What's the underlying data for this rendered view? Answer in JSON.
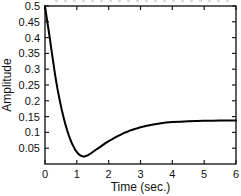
{
  "figure": {
    "background": "#ffffff"
  },
  "chart_data": {
    "type": "line",
    "xlabel": "Time (sec.)",
    "ylabel": "Amplitude",
    "xlim": [
      0,
      6
    ],
    "ylim": [
      0,
      0.5
    ],
    "xticks": [
      [
        0,
        "0"
      ],
      [
        1,
        "1"
      ],
      [
        2,
        "2"
      ],
      [
        3,
        "3"
      ],
      [
        4,
        "4"
      ],
      [
        5,
        "5"
      ],
      [
        6,
        "6"
      ]
    ],
    "yticks": [
      [
        0.05,
        "0.05"
      ],
      [
        0.1,
        "0.1"
      ],
      [
        0.15,
        "0.15"
      ],
      [
        0.2,
        "0.2"
      ],
      [
        0.25,
        "0.25"
      ],
      [
        0.3,
        "0.3"
      ],
      [
        0.35,
        "0.35"
      ],
      [
        0.4,
        "0.4"
      ],
      [
        0.45,
        "0.45"
      ],
      [
        0.5,
        "0.5"
      ]
    ],
    "grid": false,
    "legend": null,
    "box": true,
    "line_color": "#000000",
    "line_width": 2,
    "axis_color": "#1a1a1a",
    "series": [
      {
        "name": "response-curve",
        "points": [
          [
            0.0,
            0.5
          ],
          [
            0.05,
            0.465
          ],
          [
            0.1,
            0.432
          ],
          [
            0.15,
            0.398
          ],
          [
            0.2,
            0.362
          ],
          [
            0.25,
            0.328
          ],
          [
            0.3,
            0.295
          ],
          [
            0.35,
            0.263
          ],
          [
            0.4,
            0.234
          ],
          [
            0.45,
            0.208
          ],
          [
            0.5,
            0.184
          ],
          [
            0.55,
            0.161
          ],
          [
            0.6,
            0.141
          ],
          [
            0.65,
            0.122
          ],
          [
            0.7,
            0.105
          ],
          [
            0.75,
            0.09
          ],
          [
            0.8,
            0.076
          ],
          [
            0.85,
            0.064
          ],
          [
            0.9,
            0.054
          ],
          [
            0.95,
            0.045
          ],
          [
            1.0,
            0.038
          ],
          [
            1.05,
            0.032
          ],
          [
            1.1,
            0.028
          ],
          [
            1.15,
            0.025
          ],
          [
            1.2,
            0.024
          ],
          [
            1.25,
            0.024
          ],
          [
            1.3,
            0.026
          ],
          [
            1.35,
            0.028
          ],
          [
            1.4,
            0.031
          ],
          [
            1.5,
            0.038
          ],
          [
            1.6,
            0.045
          ],
          [
            1.7,
            0.052
          ],
          [
            1.8,
            0.059
          ],
          [
            1.9,
            0.066
          ],
          [
            2.0,
            0.072
          ],
          [
            2.1,
            0.078
          ],
          [
            2.2,
            0.084
          ],
          [
            2.3,
            0.089
          ],
          [
            2.4,
            0.094
          ],
          [
            2.5,
            0.099
          ],
          [
            2.6,
            0.103
          ],
          [
            2.7,
            0.107
          ],
          [
            2.8,
            0.11
          ],
          [
            2.9,
            0.113
          ],
          [
            3.0,
            0.116
          ],
          [
            3.2,
            0.121
          ],
          [
            3.4,
            0.125
          ],
          [
            3.6,
            0.128
          ],
          [
            3.8,
            0.131
          ],
          [
            4.0,
            0.133
          ],
          [
            4.25,
            0.134
          ],
          [
            4.5,
            0.135
          ],
          [
            4.75,
            0.136
          ],
          [
            5.0,
            0.137
          ],
          [
            5.25,
            0.137
          ],
          [
            5.5,
            0.138
          ],
          [
            5.75,
            0.138
          ],
          [
            6.0,
            0.138
          ]
        ]
      }
    ]
  }
}
